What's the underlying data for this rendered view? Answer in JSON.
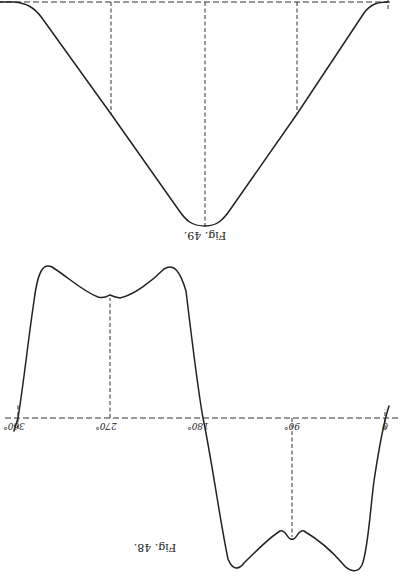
{
  "orientation": "rotated-180",
  "figures": [
    {
      "id": "fig49",
      "caption": "Fig. 49.",
      "description": "V-shaped curve below a dashed baseline, with three dashed vertical ordinates"
    },
    {
      "id": "fig48",
      "caption": "Fig. 48.",
      "description": "Periodic wave over one cycle, positive half with two peaks and central bump, negative half mirrored",
      "axis_labels": [
        "0",
        "90°",
        "180°",
        "270°",
        "360°"
      ]
    }
  ]
}
